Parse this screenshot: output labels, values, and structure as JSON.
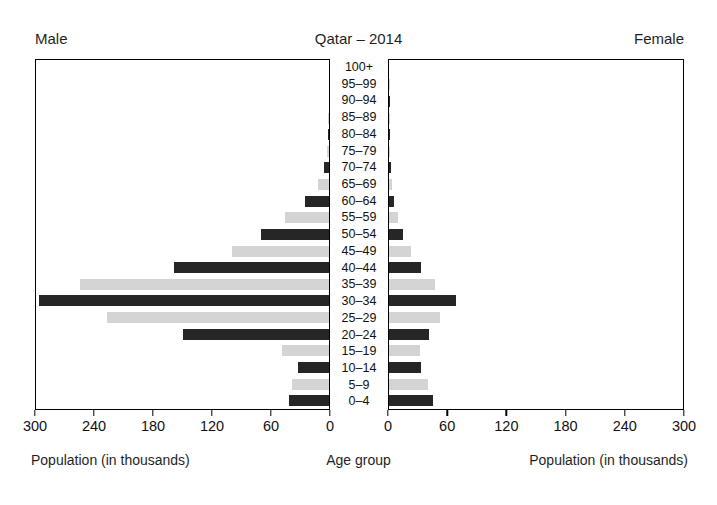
{
  "header": {
    "male_label": "Male",
    "title": "Qatar – 2014",
    "female_label": "Female"
  },
  "captions": {
    "left": "Population (in thousands)",
    "center": "Age group",
    "right": "Population (in thousands)"
  },
  "axis": {
    "left_ticks": [
      "300",
      "240",
      "180",
      "120",
      "60",
      "0"
    ],
    "right_ticks": [
      "0",
      "60",
      "120",
      "180",
      "240",
      "300"
    ],
    "max": 300,
    "tick_step": 60
  },
  "colors": {
    "bar_dark": "#262626",
    "bar_light": "#d4d4d4",
    "axis": "#000000",
    "background": "#ffffff",
    "text": "#1a1a1a"
  },
  "chart_data": {
    "type": "bar",
    "title": "Qatar – 2014",
    "subtitle": "",
    "xlabel": "Population (in thousands)",
    "ylabel": "Age group",
    "orientation": "horizontal",
    "layout": "population-pyramid",
    "xlim": [
      0,
      300
    ],
    "xticks": [
      0,
      60,
      120,
      180,
      240,
      300
    ],
    "grid": false,
    "legend": "none",
    "left_axis_reversed": true,
    "bar_shading": "alternating dark/light by age band",
    "categories": [
      "0–4",
      "5–9",
      "10–14",
      "15–19",
      "20–24",
      "25–29",
      "30–34",
      "35–39",
      "40–44",
      "45–49",
      "50–54",
      "55–59",
      "60–64",
      "65–69",
      "70–74",
      "75–79",
      "80–84",
      "85–89",
      "90–94",
      "95–99",
      "100+"
    ],
    "series": [
      {
        "name": "Male",
        "side": "left",
        "values": [
          41,
          38,
          32,
          48,
          149,
          227,
          297,
          255,
          159,
          99,
          70,
          45,
          25,
          11,
          5,
          2.5,
          1.5,
          0.8,
          0.4,
          0.2,
          0.1
        ]
      },
      {
        "name": "Female",
        "side": "right",
        "values": [
          45,
          40,
          33,
          32,
          41,
          52,
          68,
          47,
          33,
          22,
          14,
          9,
          5,
          3,
          2,
          1.2,
          0.8,
          0.4,
          0.2,
          0.1,
          0.05
        ]
      }
    ]
  }
}
